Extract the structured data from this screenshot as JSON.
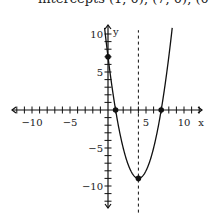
{
  "caption": "intercepts (1, 0), (7, 0), (0, 7)",
  "chart_data": {
    "type": "line",
    "title": "intercepts (1, 0), (7, 0), (0, 7)",
    "function": "y = x^2 - 8x + 7",
    "xlabel": "x",
    "ylabel": "y",
    "xlim": [
      -12.5,
      12.5
    ],
    "ylim": [
      -13,
      11
    ],
    "x_ticks": [
      -10,
      -5,
      5,
      10
    ],
    "y_ticks": [
      10,
      5,
      -5,
      -10
    ],
    "axis_of_symmetry": {
      "x": 4,
      "style": "dashed"
    },
    "points": [
      {
        "label": "x-intercept",
        "x": 1,
        "y": 0
      },
      {
        "label": "x-intercept",
        "x": 7,
        "y": 0
      },
      {
        "label": "y-intercept",
        "x": 0,
        "y": 7
      },
      {
        "label": "vertex",
        "x": 4,
        "y": -9
      }
    ],
    "grid": false
  }
}
